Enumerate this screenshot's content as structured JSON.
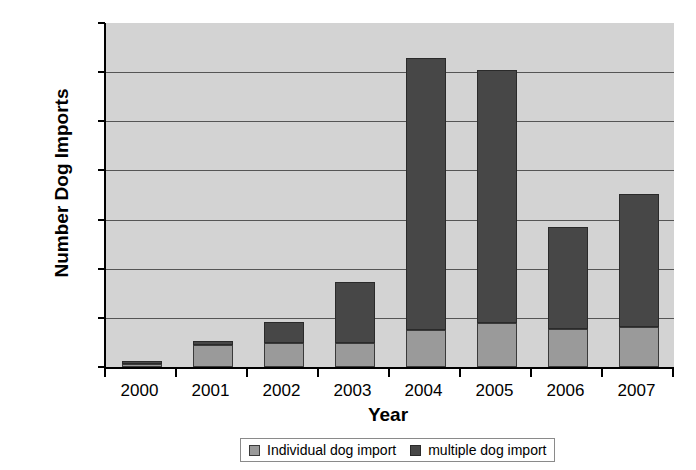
{
  "chart_data": {
    "type": "bar",
    "subtype": "stacked-vertical",
    "title": "",
    "xlabel": "Year",
    "ylabel": "Number Dog Imports",
    "categories": [
      "2000",
      "2001",
      "2002",
      "2003",
      "2004",
      "2005",
      "2006",
      "2007"
    ],
    "ylim": [
      0,
      3500
    ],
    "ytick_values": [
      0,
      500,
      1000,
      1500,
      2000,
      2500,
      3000,
      3500
    ],
    "ytick_labels": [
      "0",
      "500",
      "1000",
      "1500",
      "2000",
      "2500",
      "3000",
      "3500"
    ],
    "grid": "horizontal",
    "legend_position": "bottom-center",
    "plot_background": "#d3d3d3",
    "series": [
      {
        "name": "Individual dog import",
        "color": "#9a9a9a",
        "values": [
          35,
          220,
          245,
          245,
          375,
          450,
          385,
          410
        ]
      },
      {
        "name": "multiple dog import",
        "color": "#474747",
        "values": [
          30,
          40,
          215,
          620,
          2765,
          2570,
          1035,
          1350
        ]
      }
    ],
    "totals": [
      65,
      260,
      460,
      865,
      3140,
      3020,
      1420,
      1760
    ]
  },
  "legend": {
    "entries": [
      {
        "label": "Individual dog import",
        "swatch": "individual"
      },
      {
        "label": "multiple dog import",
        "swatch": "multiple"
      }
    ]
  }
}
